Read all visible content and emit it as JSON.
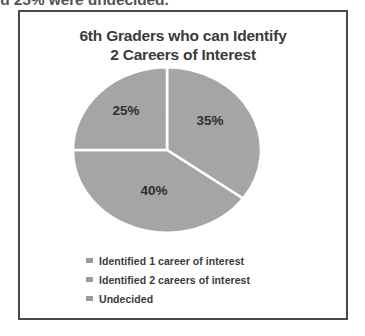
{
  "page": {
    "clipped_sentence_fragment": "sts and 25% were undecided."
  },
  "chart_data": {
    "type": "pie",
    "title": "6th Graders who can Identify 2 Careers of Interest",
    "title_line_1": "6th Graders who can Identify",
    "title_line_2": "2 Careers of Interest",
    "categories": [
      "Identified 1 career of interest",
      "Identified 2 careers of interest",
      "Undecided"
    ],
    "values": [
      35,
      40,
      25
    ],
    "value_labels": [
      "35%",
      "40%",
      "25%"
    ],
    "slice_colors": [
      "#a6a6a6",
      "#a6a6a6",
      "#a6a6a6"
    ],
    "slice_border_color": "#ffffff",
    "legend_position": "bottom",
    "legend_marker_color": "#9a9a9a",
    "grid": false,
    "start_angle_deg": 0,
    "direction": "clockwise",
    "slices": [
      {
        "label": "Identified 1 career of interest",
        "value": 35,
        "value_label": "35%",
        "position": "right"
      },
      {
        "label": "Identified 2 careers of interest",
        "value": 40,
        "value_label": "40%",
        "position": "bottom-left"
      },
      {
        "label": "Undecided",
        "value": 25,
        "value_label": "25%",
        "position": "top-left"
      }
    ]
  },
  "legend": {
    "items": [
      {
        "label": "Identified 1 career of interest"
      },
      {
        "label": "Identified 2 careers of interest"
      },
      {
        "label": "Undecided"
      }
    ]
  }
}
